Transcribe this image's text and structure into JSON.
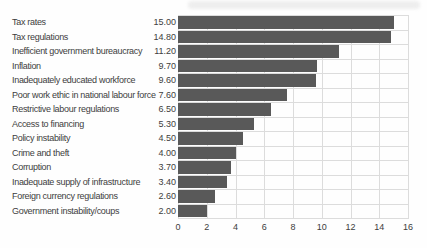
{
  "chart_data": {
    "type": "bar",
    "orientation": "horizontal",
    "title": "",
    "xlabel": "",
    "ylabel": "",
    "xlim": [
      0,
      16
    ],
    "grid": true,
    "legend": "none",
    "bar_color": "#595959",
    "grid_color": "#dcdcdc",
    "text_color": "#3d3d3d",
    "categories": [
      "Tax rates",
      "Tax regulations",
      "Inefficient government bureaucracy",
      "Inflation",
      "Inadequately educated workforce",
      "Poor work ethic in national labour force",
      "Restrictive labour regulations",
      "Access to financing",
      "Policy instability",
      "Crime and theft",
      "Corruption",
      "Inadequate supply of infrastructure",
      "Foreign currency regulations",
      "Government instability/coups"
    ],
    "values": [
      15.0,
      14.8,
      11.2,
      9.7,
      9.6,
      7.6,
      6.5,
      5.3,
      4.5,
      4.0,
      3.7,
      3.4,
      2.6,
      2.0
    ],
    "value_labels": [
      "15.00",
      "14.80",
      "11.20",
      "9.70",
      "9.60",
      "7.60",
      "6.50",
      "5.30",
      "4.50",
      "4.00",
      "3.70",
      "3.40",
      "2.60",
      "2.00"
    ],
    "xticks": [
      "0",
      "2",
      "4",
      "6",
      "8",
      "10",
      "12",
      "14",
      "16"
    ]
  }
}
